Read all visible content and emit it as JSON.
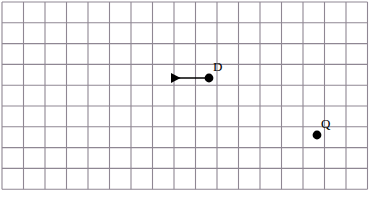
{
  "figure": {
    "type": "grid-diagram",
    "width": 378,
    "height": 203,
    "background_color": "#ffffff"
  },
  "grid": {
    "columns": 17,
    "rows": 9,
    "cell_width": 21.5,
    "cell_height": 20.8,
    "origin_x": 2,
    "origin_y": 2,
    "line_color": "#8f8793",
    "line_width": 1.1
  },
  "points": [
    {
      "id": "point-d",
      "label": "D",
      "x": 209,
      "y": 78,
      "radius": 4.4,
      "color": "#000000",
      "label_x": 213,
      "label_y": 60
    },
    {
      "id": "point-q",
      "label": "Q",
      "x": 317,
      "y": 135,
      "radius": 4.4,
      "color": "#000000",
      "label_x": 321,
      "label_y": 117
    }
  ],
  "vectors": [
    {
      "id": "vector-d-left",
      "from_point": "point-d",
      "x1": 209,
      "y1": 78,
      "x2": 171,
      "y2": 78,
      "color": "#000000",
      "stroke_width": 1.6,
      "arrowhead": "end",
      "direction": "left"
    }
  ]
}
